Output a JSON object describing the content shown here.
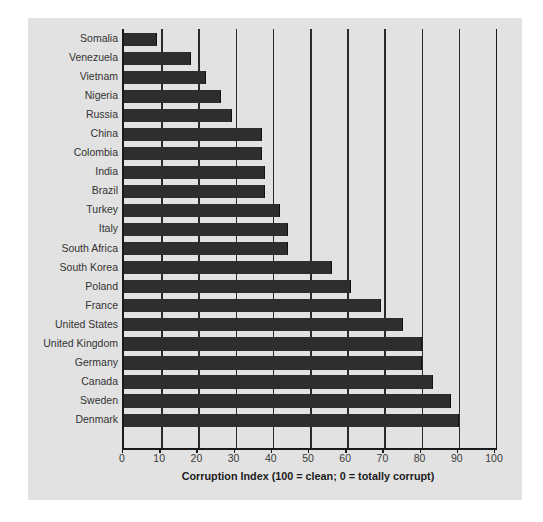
{
  "chart_data": {
    "type": "bar",
    "orientation": "horizontal",
    "title": "",
    "xlabel": "Corruption Index (100 = clean; 0 = totally corrupt)",
    "ylabel": "",
    "xlim": [
      0,
      100
    ],
    "xticks": [
      0,
      10,
      20,
      30,
      40,
      50,
      60,
      70,
      80,
      90,
      100
    ],
    "grid": "vertical gridlines at every 10 units",
    "legend": "none",
    "bar_color": "#2e2e2e",
    "panel_color": "#e2e2e2",
    "categories": [
      "Somalia",
      "Venezuela",
      "Vietnam",
      "Nigeria",
      "Russia",
      "China",
      "Colombia",
      "India",
      "Brazil",
      "Turkey",
      "Italy",
      "South Africa",
      "South Korea",
      "Poland",
      "France",
      "United States",
      "United Kingdom",
      "Germany",
      "Canada",
      "Sweden",
      "Denmark"
    ],
    "values": [
      9,
      18,
      22,
      26,
      29,
      37,
      37,
      38,
      38,
      42,
      44,
      44,
      56,
      61,
      69,
      75,
      80,
      80,
      83,
      88,
      90
    ]
  },
  "axis": {
    "x_title": "Corruption Index (100 = clean; 0 = totally corrupt)"
  }
}
